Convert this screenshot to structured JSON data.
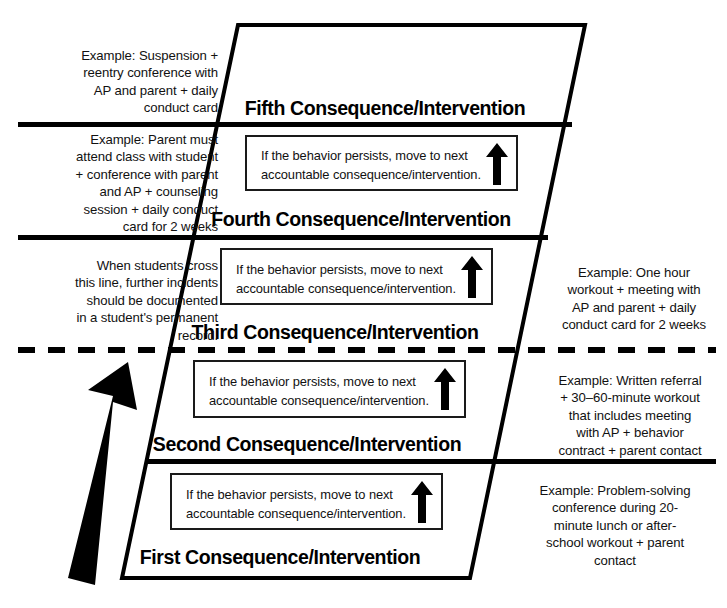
{
  "diagram": {
    "persist_message": "If the behavior persists, move to next\naccountable consequence/intervention.",
    "documentation_note": "When students cross\nthis line, further incidents\nshould be documented\nin a student's permanent\nrecord.",
    "colors": {
      "ink": "#000000",
      "background": "#ffffff",
      "box_border": "#1a1a1a"
    },
    "levels": [
      {
        "id": "fifth",
        "heading": "Fifth Consequence/Intervention",
        "example_side": "left",
        "example": "Example: Suspension +\nreentry conference with\nAP and parent + daily\nconduct card"
      },
      {
        "id": "fourth",
        "heading": "Fourth Consequence/Intervention",
        "example_side": "left",
        "example": "Example: Parent must\nattend class with student\n+ conference with parent\nand AP + counseling\nsession + daily conduct\ncard  for 2 weeks"
      },
      {
        "id": "third",
        "heading": "Third Consequence/Intervention",
        "example_side": "right",
        "example": "Example: One hour\nworkout + meeting with\nAP and parent + daily\nconduct card for 2 weeks"
      },
      {
        "id": "second",
        "heading": "Second Consequence/Intervention",
        "example_side": "right",
        "example": "Example: Written referral\n+ 30–60-minute workout\nthat includes meeting\nwith AP + behavior\ncontract + parent contact"
      },
      {
        "id": "first",
        "heading": "First Consequence/Intervention",
        "example_side": "right",
        "example": "Example: Problem-solving\nconference during 20-\nminute lunch or after-\nschool workout + parent\ncontact"
      }
    ]
  }
}
